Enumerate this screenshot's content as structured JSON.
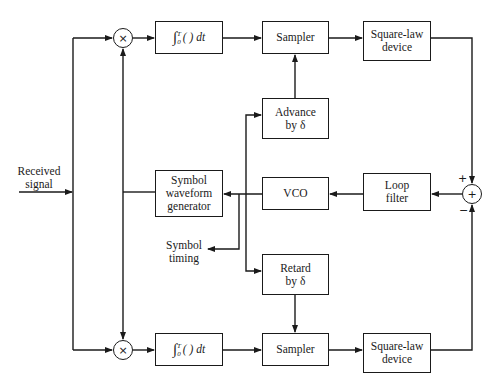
{
  "diagram": {
    "type": "block-diagram",
    "input": {
      "label_line1": "Received",
      "label_line2": "signal"
    },
    "upper_branch": {
      "multiplier": {
        "symbol": "×"
      },
      "integrator": {
        "integral_sign": "∫",
        "lower_limit": "0",
        "upper_limit": "T",
        "body": "( ) dt"
      },
      "sampler": {
        "label": "Sampler"
      },
      "square_law": {
        "line1": "Square-law",
        "line2": "device"
      }
    },
    "lower_branch": {
      "multiplier": {
        "symbol": "×"
      },
      "integrator": {
        "integral_sign": "∫",
        "lower_limit": "0",
        "upper_limit": "T",
        "body": "( ) dt"
      },
      "sampler": {
        "label": "Sampler"
      },
      "square_law": {
        "line1": "Square-law",
        "line2": "device"
      }
    },
    "advance": {
      "line1": "Advance",
      "line2": "by δ"
    },
    "retard": {
      "line1": "Retard",
      "line2": "by δ"
    },
    "vco": {
      "label": "VCO"
    },
    "loop_filter": {
      "line1": "Loop",
      "line2": "filter"
    },
    "summer": {
      "symbol": "+",
      "plus_sign": "+",
      "minus_sign": "−"
    },
    "waveform_generator": {
      "line1": "Symbol",
      "line2": "waveform",
      "line3": "generator"
    },
    "symbol_timing": {
      "line1": "Symbol",
      "line2": "timing"
    }
  },
  "colors": {
    "ink": "#1a1a1a",
    "background": "#ffffff"
  }
}
